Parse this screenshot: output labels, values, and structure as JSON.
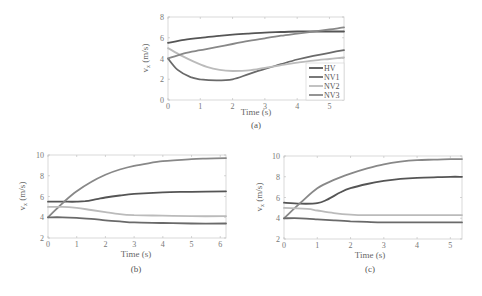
{
  "figure": {
    "panels": [
      "(a)",
      "(b)",
      "(c)"
    ]
  },
  "chart_data": [
    {
      "type": "line",
      "caption": "(a)",
      "xlabel": "Time (s)",
      "ylabel": "v_x (m/s)",
      "xlim": [
        0,
        5.45
      ],
      "ylim": [
        0,
        8
      ],
      "xticks": [
        0,
        1,
        2,
        3,
        4,
        5
      ],
      "yticks": [
        0,
        2,
        4,
        6,
        8
      ],
      "grid": false,
      "legend": {
        "position": "lower right",
        "entries": [
          "HV",
          "NV1",
          "NV2",
          "NV3"
        ]
      },
      "series": [
        {
          "name": "HV",
          "color": "#555555",
          "x": [
            0,
            0.5,
            1,
            1.5,
            2,
            2.5,
            3,
            3.5,
            4,
            4.5,
            5,
            5.45
          ],
          "y": [
            5.5,
            5.8,
            6.0,
            6.15,
            6.3,
            6.4,
            6.5,
            6.55,
            6.6,
            6.6,
            6.6,
            6.6
          ]
        },
        {
          "name": "NV1",
          "color": "#6a6a6a",
          "x": [
            0,
            0.3,
            0.7,
            1.0,
            1.5,
            2.0,
            2.5,
            3.0,
            3.5,
            4.0,
            4.5,
            5.0,
            5.45
          ],
          "y": [
            4.0,
            2.9,
            2.2,
            2.0,
            1.9,
            2.0,
            2.5,
            3.0,
            3.45,
            3.9,
            4.25,
            4.55,
            4.8
          ]
        },
        {
          "name": "NV2",
          "color": "#bbbbbb",
          "x": [
            0,
            0.4,
            0.8,
            1.2,
            1.6,
            2.0,
            2.5,
            3.0,
            3.5,
            4.0,
            4.5,
            5.0,
            5.45
          ],
          "y": [
            5.0,
            4.3,
            3.7,
            3.2,
            2.9,
            2.8,
            2.85,
            3.1,
            3.35,
            3.6,
            3.8,
            3.95,
            4.1
          ]
        },
        {
          "name": "NV3",
          "color": "#888888",
          "x": [
            0,
            0.5,
            1.0,
            1.5,
            2.0,
            2.5,
            3.0,
            3.5,
            4.0,
            4.5,
            5.0,
            5.45
          ],
          "y": [
            4.0,
            4.5,
            4.8,
            5.1,
            5.4,
            5.7,
            5.95,
            6.2,
            6.4,
            6.6,
            6.8,
            7.0
          ]
        }
      ]
    },
    {
      "type": "line",
      "caption": "(b)",
      "xlabel": "Time (s)",
      "ylabel": "v_x (m/s)",
      "xlim": [
        0,
        6.2
      ],
      "ylim": [
        2,
        10
      ],
      "xticks": [
        0,
        1,
        2,
        3,
        4,
        5,
        6
      ],
      "yticks": [
        2,
        4,
        6,
        8,
        10
      ],
      "grid": false,
      "series": [
        {
          "name": "HV",
          "color": "#555555",
          "x": [
            0,
            0.5,
            1.0,
            1.3,
            1.7,
            2.0,
            2.5,
            3.0,
            4.0,
            5.0,
            6.2
          ],
          "y": [
            5.5,
            5.5,
            5.5,
            5.55,
            5.75,
            5.9,
            6.1,
            6.25,
            6.4,
            6.45,
            6.5
          ]
        },
        {
          "name": "NV1",
          "color": "#888888",
          "x": [
            0,
            0.3,
            0.6,
            1.0,
            1.5,
            2.0,
            2.5,
            3.0,
            3.5,
            4.0,
            4.5,
            5.0,
            5.5,
            6.2
          ],
          "y": [
            4.0,
            4.8,
            5.6,
            6.5,
            7.4,
            8.1,
            8.6,
            8.95,
            9.2,
            9.4,
            9.5,
            9.6,
            9.65,
            9.7
          ]
        },
        {
          "name": "NV2",
          "color": "#bbbbbb",
          "x": [
            0,
            0.5,
            1.0,
            1.5,
            2.0,
            2.5,
            3.0,
            4.0,
            5.0,
            6.2
          ],
          "y": [
            5.0,
            5.0,
            4.9,
            4.7,
            4.5,
            4.3,
            4.2,
            4.15,
            4.1,
            4.1
          ]
        },
        {
          "name": "NV3",
          "color": "#6a6a6a",
          "x": [
            0,
            0.5,
            1.0,
            1.5,
            2.0,
            2.5,
            3.0,
            4.0,
            5.0,
            6.2
          ],
          "y": [
            4.0,
            4.0,
            3.95,
            3.85,
            3.7,
            3.6,
            3.5,
            3.45,
            3.4,
            3.4
          ]
        }
      ]
    },
    {
      "type": "line",
      "caption": "(c)",
      "xlabel": "Time (s)",
      "ylabel": "v_x (m/s)",
      "xlim": [
        0,
        5.35
      ],
      "ylim": [
        2,
        10
      ],
      "xticks": [
        0,
        1,
        2,
        3,
        4,
        5
      ],
      "yticks": [
        2,
        4,
        6,
        8,
        10
      ],
      "grid": false,
      "series": [
        {
          "name": "HV",
          "color": "#555555",
          "x": [
            0,
            0.5,
            1.0,
            1.3,
            1.7,
            2.0,
            2.5,
            3.0,
            3.5,
            4.0,
            4.5,
            5.0,
            5.35
          ],
          "y": [
            5.5,
            5.4,
            5.45,
            5.8,
            6.5,
            6.9,
            7.3,
            7.6,
            7.8,
            7.9,
            7.95,
            8.0,
            8.0
          ]
        },
        {
          "name": "NV1",
          "color": "#888888",
          "x": [
            0,
            0.5,
            1.0,
            1.5,
            2.0,
            2.5,
            3.0,
            3.5,
            4.0,
            4.5,
            5.0,
            5.35
          ],
          "y": [
            4.0,
            5.5,
            6.9,
            7.7,
            8.3,
            8.8,
            9.2,
            9.45,
            9.6,
            9.65,
            9.7,
            9.7
          ]
        },
        {
          "name": "NV2",
          "color": "#bbbbbb",
          "x": [
            0,
            0.7,
            1.0,
            1.5,
            2.0,
            2.5,
            3.0,
            4.0,
            5.35
          ],
          "y": [
            5.0,
            4.9,
            4.75,
            4.5,
            4.35,
            4.3,
            4.3,
            4.3,
            4.3
          ]
        },
        {
          "name": "NV3",
          "color": "#6a6a6a",
          "x": [
            0,
            0.5,
            1.0,
            1.5,
            2.0,
            2.5,
            3.0,
            4.0,
            5.35
          ],
          "y": [
            4.0,
            4.0,
            3.9,
            3.8,
            3.7,
            3.65,
            3.6,
            3.6,
            3.6
          ]
        }
      ]
    }
  ],
  "layout": {
    "panels": [
      {
        "left": 168,
        "top": 17,
        "right": 344,
        "bottom": 100
      },
      {
        "left": 48,
        "top": 155,
        "right": 226,
        "bottom": 238
      },
      {
        "left": 284,
        "top": 156,
        "right": 462,
        "bottom": 239
      }
    ],
    "captionPos": [
      [
        256,
        128
      ],
      [
        136,
        272
      ],
      [
        370,
        272
      ]
    ],
    "xlabelPos": [
      [
        256,
        115
      ],
      [
        136,
        257
      ],
      [
        370,
        258
      ]
    ],
    "ylabelPos": [
      [
        148,
        58
      ],
      [
        25,
        196
      ],
      [
        262,
        197
      ]
    ]
  }
}
